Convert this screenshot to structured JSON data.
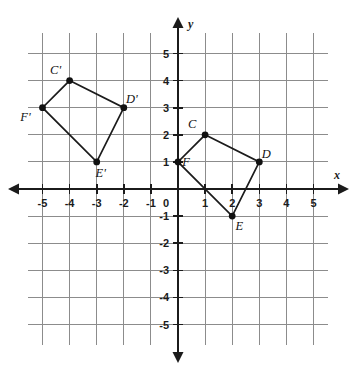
{
  "chart_data": {
    "type": "scatter",
    "title": "",
    "xlabel": "x",
    "ylabel": "y",
    "xlim": [
      -6,
      6
    ],
    "ylim": [
      -6,
      6
    ],
    "grid": true,
    "legend": "none",
    "origin_label": "0",
    "x_ticks": [
      -5,
      -4,
      -3,
      -2,
      -1,
      1,
      2,
      3,
      4,
      5
    ],
    "y_ticks": [
      5,
      4,
      3,
      2,
      1,
      -1,
      -2,
      -3,
      -4,
      -5
    ],
    "x_tick_labels": [
      "-5",
      "-4",
      "-3",
      "-2",
      "-1",
      "1",
      "2",
      "3",
      "4",
      "5"
    ],
    "y_tick_labels": [
      "5",
      "4",
      "3",
      "2",
      "1",
      "-1",
      "-2",
      "-3",
      "-4",
      "-5"
    ],
    "series": [
      {
        "name": "CDEF",
        "closed": true,
        "points": [
          {
            "label": "C",
            "x": 1,
            "y": 2,
            "label_dx": -13,
            "label_dy": -7
          },
          {
            "label": "D",
            "x": 3,
            "y": 1,
            "label_dx": 7,
            "label_dy": -4
          },
          {
            "label": "E",
            "x": 2,
            "y": -1,
            "label_dx": 7,
            "label_dy": 14
          },
          {
            "label": "F",
            "x": 0,
            "y": 1,
            "label_dx": 8,
            "label_dy": 4
          }
        ]
      },
      {
        "name": "C'D'E'F'",
        "closed": true,
        "points": [
          {
            "label": "C'",
            "x": -4,
            "y": 4,
            "label_dx": -14,
            "label_dy": -7
          },
          {
            "label": "D'",
            "x": -2,
            "y": 3,
            "label_dx": 8,
            "label_dy": -5
          },
          {
            "label": "E'",
            "x": -3,
            "y": 1,
            "label_dx": 4,
            "label_dy": 15
          },
          {
            "label": "F'",
            "x": -5,
            "y": 3,
            "label_dx": -17,
            "label_dy": 13
          }
        ]
      }
    ]
  },
  "colors": {
    "grid": "#8c8c8c",
    "axis": "#1b1b1b",
    "figure_stroke": "#1b1b1b",
    "vertex": "#111111",
    "background": "#ffffff"
  }
}
